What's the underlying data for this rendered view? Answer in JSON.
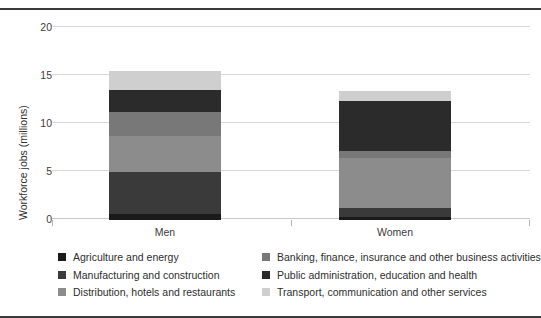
{
  "chart_data": {
    "type": "bar",
    "subtype": "stacked",
    "title": "",
    "xlabel": "",
    "ylabel": "Workforce jobs (millions)",
    "categories": [
      "Men",
      "Women"
    ],
    "ylim": [
      0,
      20
    ],
    "yticks": [
      0,
      5,
      10,
      15,
      20
    ],
    "ytick_labels": [
      "0",
      "5",
      "10",
      "15",
      "20"
    ],
    "grid": true,
    "legend_position": "bottom",
    "series": [
      {
        "name": "Agriculture and energy",
        "color": "#1a1a1a",
        "values": [
          0.6,
          0.35
        ]
      },
      {
        "name": "Manufacturing and construction",
        "color": "#3a3a3a",
        "values": [
          4.4,
          0.95
        ]
      },
      {
        "name": "Distribution, hotels and restaurants",
        "color": "#8c8c8c",
        "values": [
          3.75,
          5.2
        ]
      },
      {
        "name": "Banking, finance, insurance and other business activities",
        "color": "#787878",
        "values": [
          2.5,
          0.7
        ]
      },
      {
        "name": "Public administration, education and health",
        "color": "#2b2b2b",
        "values": [
          2.3,
          5.25
        ]
      },
      {
        "name": "Transport, communication and other services",
        "color": "#cfcfcf",
        "values": [
          2.0,
          0.95
        ]
      }
    ],
    "totals": [
      15.55,
      13.4
    ]
  },
  "axis": {
    "y_title": "Workforce jobs (millions)",
    "tick_20": "20",
    "tick_15": "15",
    "tick_10": "10",
    "tick_5": "5",
    "tick_0": "0",
    "cat_men": "Men",
    "cat_women": "Women"
  },
  "legend": {
    "left": [
      {
        "label": "Agriculture and energy",
        "color": "#1a1a1a"
      },
      {
        "label": "Manufacturing and construction",
        "color": "#3a3a3a"
      },
      {
        "label": "Distribution, hotels and restaurants",
        "color": "#8c8c8c"
      }
    ],
    "right": [
      {
        "label": "Banking, finance, insurance and other business activities",
        "color": "#787878"
      },
      {
        "label": "Public administration, education and health",
        "color": "#2b2b2b"
      },
      {
        "label": "Transport, communication and other services",
        "color": "#cfcfcf"
      }
    ]
  }
}
